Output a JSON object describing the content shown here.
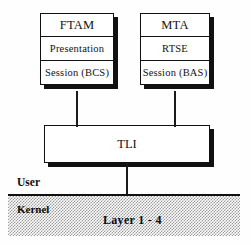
{
  "diagram": {
    "stacks": [
      {
        "name": "ftam-stack",
        "cells": [
          {
            "label": "FTAM",
            "role": "application"
          },
          {
            "label": "Presentation",
            "role": "presentation"
          },
          {
            "label": "Session (BCS)",
            "role": "session"
          }
        ]
      },
      {
        "name": "mta-stack",
        "cells": [
          {
            "label": "MTA",
            "role": "application"
          },
          {
            "label": "RTSE",
            "role": "reliable-transfer"
          },
          {
            "label": "Session (BAS)",
            "role": "session"
          }
        ]
      }
    ],
    "transport": {
      "label": "TLI"
    },
    "boundary": {
      "user_label": "User",
      "kernel_label": "Kernel",
      "kernel_band_label": "Layer 1 - 4"
    },
    "colors": {
      "line": "#111111",
      "shadow": "#111111",
      "box_fill": "#ffffff",
      "kernel_band": "#9a9a9a",
      "text": "#121212",
      "background": "#fefefe"
    }
  }
}
